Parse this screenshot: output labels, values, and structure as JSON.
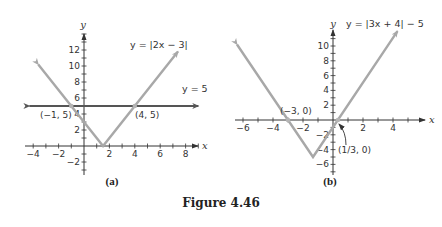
{
  "caption": "Figure 4.46",
  "chart_data": [
    {
      "type": "line",
      "panel_label": "(a)",
      "xlabel": "x",
      "ylabel": "y",
      "xlim": [
        -4.5,
        9
      ],
      "ylim": [
        -3.5,
        14
      ],
      "xticks": [
        -4,
        -2,
        2,
        4,
        6,
        8
      ],
      "yticks": [
        -2,
        2,
        4,
        6,
        8,
        10,
        12
      ],
      "series": [
        {
          "name": "y = |2x − 3|",
          "color": "#a8a8a8",
          "points": [
            [
              -3.6,
              10.2
            ],
            [
              1.5,
              0
            ],
            [
              7.4,
              11.8
            ]
          ]
        },
        {
          "name": "y = 5",
          "color": "#555555",
          "points": [
            [
              -4.3,
              5
            ],
            [
              9.0,
              5
            ]
          ]
        }
      ],
      "annotations": [
        {
          "text": "(−1, 5)",
          "x": -1,
          "y": 5
        },
        {
          "text": "(4, 5)",
          "x": 4,
          "y": 5
        }
      ],
      "labels": {
        "curve": "y = |2x − 3|",
        "line": "y = 5"
      }
    },
    {
      "type": "line",
      "panel_label": "(b)",
      "xlabel": "x",
      "ylabel": "y",
      "xlim": [
        -6.5,
        5
      ],
      "ylim": [
        -7,
        11.5
      ],
      "xticks": [
        -6,
        -4,
        -2,
        2,
        4
      ],
      "yticks": [
        -6,
        -4,
        -2,
        2,
        4,
        6,
        8,
        10
      ],
      "series": [
        {
          "name": "y = |3x + 4| − 5",
          "color": "#a8a8a8",
          "points": [
            [
              -6.4,
              10.2
            ],
            [
              -1.333,
              -5
            ],
            [
              4.3,
              12
            ]
          ]
        }
      ],
      "annotations": [
        {
          "text": "(−3, 0)",
          "x": -3,
          "y": 0
        },
        {
          "text": "(1/3, 0)",
          "x": 0.333,
          "y": 0
        }
      ],
      "labels": {
        "curve": "y = |3x + 4| − 5"
      }
    }
  ]
}
